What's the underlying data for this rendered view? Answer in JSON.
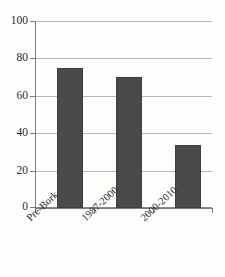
{
  "chart_data": {
    "type": "bar",
    "title": "",
    "xlabel": "",
    "ylabel": "",
    "categories": [
      "Pre-Bork",
      "1987-2000",
      "2000-2010"
    ],
    "values": [
      75.5,
      70.5,
      34
    ],
    "ylim": [
      0,
      100
    ],
    "yticks": [
      0,
      20,
      40,
      60,
      80,
      100
    ],
    "ytick_labels": [
      "0",
      "20",
      "40",
      "60",
      "80",
      "100"
    ],
    "grid": true,
    "legend": false,
    "bar_color": "#4a4a4a",
    "gridline_color": "#b9b9b9",
    "axis_color": "#7d7d7d",
    "background_color": "#fdfdfc"
  }
}
